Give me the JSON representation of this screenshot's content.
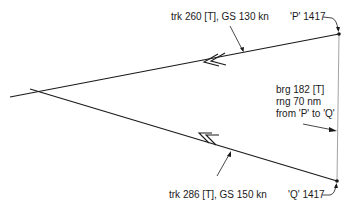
{
  "diagram": {
    "type": "relative-velocity / intercept geometry",
    "points": {
      "P": {
        "label": "'P' 1417"
      },
      "Q": {
        "label": "'Q' 1417"
      }
    },
    "tracks": [
      {
        "id": "from-P",
        "label": "trk 260 [T], GS 130 kn",
        "arrow": "double-chevron"
      },
      {
        "id": "from-Q",
        "label": "trk 286 [T], GS 150 kn",
        "arrow": "double-chevron"
      }
    ],
    "bearing": {
      "lines": [
        "brg 182 [T]",
        "rng 70 nm",
        "from 'P' to 'Q'"
      ]
    },
    "colors": {
      "line": "#1a1a1a",
      "thin_line": "#8a8a8a",
      "background": "#ffffff"
    }
  }
}
